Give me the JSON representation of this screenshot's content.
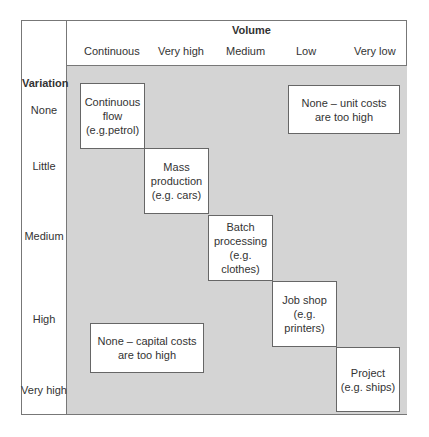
{
  "axes": {
    "x_title": "Volume",
    "y_title": "Variation",
    "columns": [
      "Continuous",
      "Very high",
      "Medium",
      "Low",
      "Very low"
    ],
    "rows": [
      "None",
      "Little",
      "Medium",
      "High",
      "Very high"
    ]
  },
  "boxes": {
    "continuous": [
      "Continuous",
      "flow",
      "(e.g.petrol)"
    ],
    "mass": [
      "Mass",
      "production",
      "(e.g. cars)"
    ],
    "batch": [
      "Batch",
      "processing",
      "(e.g. clothes)"
    ],
    "job": [
      "Job shop",
      "(e.g. printers)"
    ],
    "project": [
      "Project",
      "(e.g. ships)"
    ],
    "unit_costs": [
      "None – unit costs",
      "are too high"
    ],
    "capital_costs": [
      "None – capital costs",
      "are too high"
    ]
  },
  "colors": {
    "grid_fill": "#d4d4d4",
    "box_fill": "#ffffff",
    "border": "#777777"
  }
}
